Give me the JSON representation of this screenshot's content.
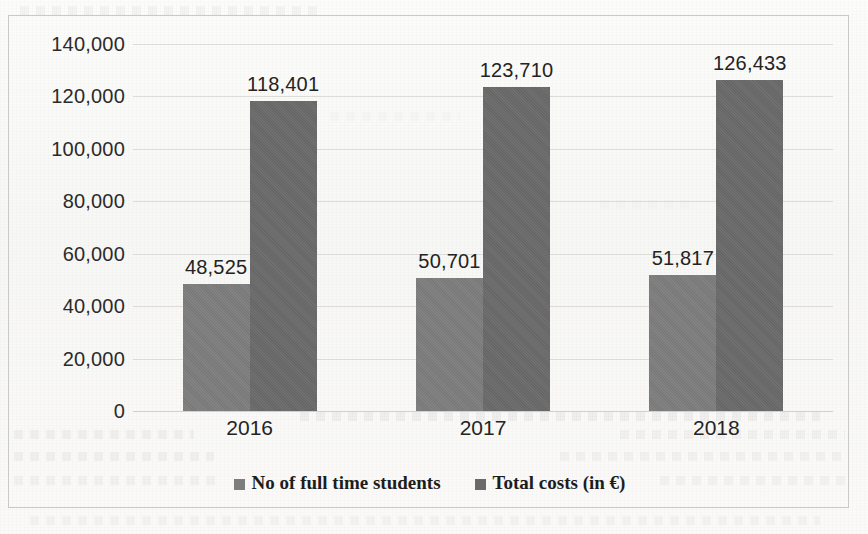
{
  "chart_data": {
    "type": "bar",
    "title": "",
    "subtitle": "",
    "xlabel": "",
    "ylabel": "",
    "categories": [
      "2016",
      "2017",
      "2018"
    ],
    "series": [
      {
        "name": "No of full time students",
        "color": "#7d7d7d",
        "values": [
          48525,
          50701,
          51817
        ],
        "labels": [
          "48,525",
          "50,701",
          "51,817"
        ]
      },
      {
        "name": "Total costs (in €)",
        "color": "#6a6a6a",
        "values": [
          118401,
          123710,
          126433
        ],
        "labels": [
          "118,401",
          "123,710",
          "126,433"
        ]
      }
    ],
    "ylim": [
      0,
      140000
    ],
    "ytick_values": [
      0,
      20000,
      40000,
      60000,
      80000,
      100000,
      120000,
      140000
    ],
    "ytick_labels": [
      "0",
      "20,000",
      "40,000",
      "60,000",
      "80,000",
      "100,000",
      "120,000",
      "140,000"
    ],
    "grid": true,
    "legend_position": "bottom",
    "data_labels_shown": true
  },
  "legend": {
    "items": [
      {
        "label": "No of full time students",
        "swatch": "legend-swatch-students"
      },
      {
        "label": "Total costs (in €)",
        "swatch": "legend-swatch-costs"
      }
    ]
  }
}
